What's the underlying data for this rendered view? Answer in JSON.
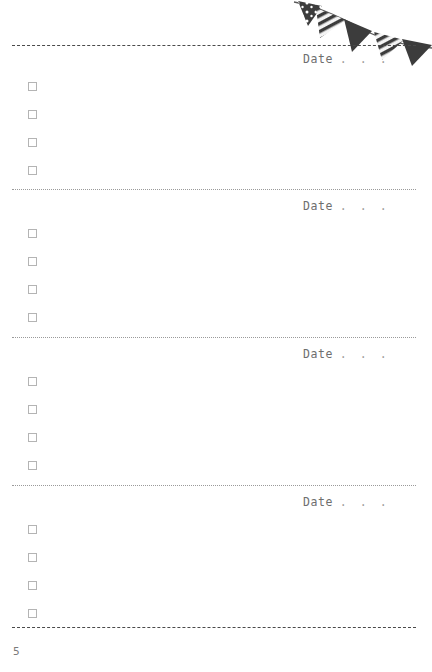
{
  "page": {
    "number": "5",
    "width": 432,
    "height": 672,
    "background": "#ffffff"
  },
  "decoration": {
    "name": "bunting-garland",
    "flag_count": 5,
    "colors": {
      "flag_dark": "#3c3c3c",
      "flag_stripe_light": "#f2f2f2",
      "string": "#5a5a5a"
    },
    "flags": [
      {
        "style": "dotted",
        "label": "flag-dotted-1"
      },
      {
        "style": "striped",
        "label": "flag-striped-1"
      },
      {
        "style": "solid",
        "label": "flag-solid-1"
      },
      {
        "style": "striped",
        "label": "flag-striped-2"
      },
      {
        "style": "solid",
        "label": "flag-solid-2"
      }
    ]
  },
  "rules": {
    "top_line_color": "#4a4a4a",
    "separator_color": "#9a9a9a",
    "bottom_line_color": "#4a4a4a"
  },
  "sections": [
    {
      "id": "section-1",
      "date": {
        "label": "Date",
        "dots": [
          ".",
          ".",
          "."
        ],
        "value": ""
      },
      "tasks": [
        {
          "id": "s1-t1",
          "checked": false,
          "text": ""
        },
        {
          "id": "s1-t2",
          "checked": false,
          "text": ""
        },
        {
          "id": "s1-t3",
          "checked": false,
          "text": ""
        },
        {
          "id": "s1-t4",
          "checked": false,
          "text": ""
        }
      ]
    },
    {
      "id": "section-2",
      "date": {
        "label": "Date",
        "dots": [
          ".",
          ".",
          "."
        ],
        "value": ""
      },
      "tasks": [
        {
          "id": "s2-t1",
          "checked": false,
          "text": ""
        },
        {
          "id": "s2-t2",
          "checked": false,
          "text": ""
        },
        {
          "id": "s2-t3",
          "checked": false,
          "text": ""
        },
        {
          "id": "s2-t4",
          "checked": false,
          "text": ""
        }
      ]
    },
    {
      "id": "section-3",
      "date": {
        "label": "Date",
        "dots": [
          ".",
          ".",
          "."
        ],
        "value": ""
      },
      "tasks": [
        {
          "id": "s3-t1",
          "checked": false,
          "text": ""
        },
        {
          "id": "s3-t2",
          "checked": false,
          "text": ""
        },
        {
          "id": "s3-t3",
          "checked": false,
          "text": ""
        },
        {
          "id": "s3-t4",
          "checked": false,
          "text": ""
        }
      ]
    },
    {
      "id": "section-4",
      "date": {
        "label": "Date",
        "dots": [
          ".",
          ".",
          "."
        ],
        "value": ""
      },
      "tasks": [
        {
          "id": "s4-t1",
          "checked": false,
          "text": ""
        },
        {
          "id": "s4-t2",
          "checked": false,
          "text": ""
        },
        {
          "id": "s4-t3",
          "checked": false,
          "text": ""
        },
        {
          "id": "s4-t4",
          "checked": false,
          "text": ""
        }
      ]
    }
  ]
}
